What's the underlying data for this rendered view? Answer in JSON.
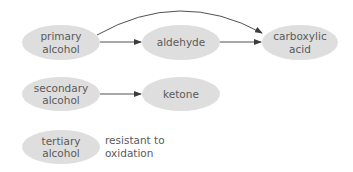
{
  "diagram": {
    "title": "",
    "colors": {
      "node_fill": "#dedede",
      "text": "#5a5a5a",
      "edge": "#3c3c3c"
    },
    "nodes": {
      "primary_alcohol": {
        "label": "primary\nalcohol"
      },
      "aldehyde": {
        "label": "aldehyde"
      },
      "carboxylic_acid": {
        "label": "carboxylic\nacid"
      },
      "secondary_alcohol": {
        "label": "secondary\nalcohol"
      },
      "ketone": {
        "label": "ketone"
      },
      "tertiary_alcohol": {
        "label": "tertiary\nalcohol"
      }
    },
    "edges": [
      {
        "from": "primary_alcohol",
        "to": "aldehyde",
        "style": "straight"
      },
      {
        "from": "aldehyde",
        "to": "carboxylic_acid",
        "style": "straight"
      },
      {
        "from": "primary_alcohol",
        "to": "carboxylic_acid",
        "style": "curved"
      },
      {
        "from": "secondary_alcohol",
        "to": "ketone",
        "style": "straight"
      }
    ],
    "notes": {
      "tertiary_note": "resistant to\noxidation"
    }
  }
}
